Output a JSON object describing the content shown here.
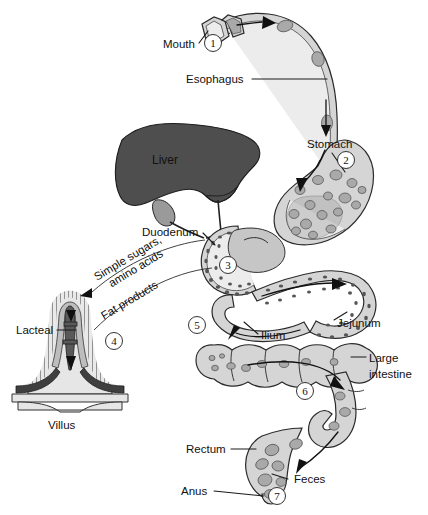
{
  "figure": {
    "type": "anatomical-diagram",
    "background_color": "#ffffff",
    "ink_color": "#111111",
    "liver_color": "#4e4e4e",
    "tract_color": "#d5d5d5",
    "chyme_color": "#a9a9a9"
  },
  "labels": {
    "mouth": "Mouth",
    "esophagus": "Esophagus",
    "stomach": "Stomach",
    "liver": "Liver",
    "duodenum": "Duodenum",
    "jejunum": "Jejunum",
    "ilium": "Ilium",
    "large_intestine_line1": "Large",
    "large_intestine_line2": "intestine",
    "rectum": "Rectum",
    "feces": "Feces",
    "anus": "Anus",
    "lacteal": "Lacteal",
    "villus": "Villus",
    "simple_sugars_line1": "Simple sugars,",
    "simple_sugars_line2": "amino acids",
    "fat_products": "Fat products"
  },
  "callout_numbers": [
    {
      "id": "1",
      "value": "1",
      "refers_to": "Mouth"
    },
    {
      "id": "2",
      "value": "2",
      "refers_to": "Stomach"
    },
    {
      "id": "3",
      "value": "3",
      "refers_to": "Duodenum"
    },
    {
      "id": "4",
      "value": "4",
      "refers_to": "Villus"
    },
    {
      "id": "5",
      "value": "5",
      "refers_to": "Ilium"
    },
    {
      "id": "6",
      "value": "6",
      "refers_to": "Large intestine"
    },
    {
      "id": "7",
      "value": "7",
      "refers_to": "Anus"
    }
  ]
}
